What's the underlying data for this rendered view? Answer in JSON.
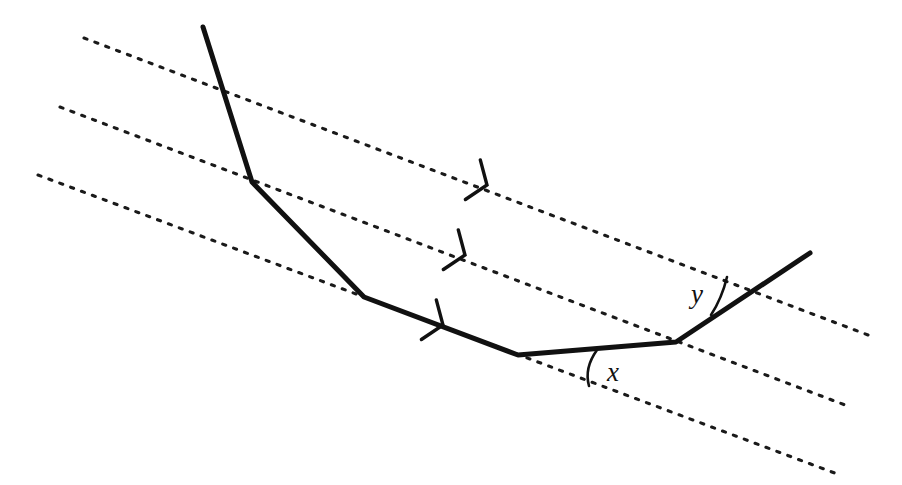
{
  "figure": {
    "background_color": "#ffffff",
    "stroke_color": "#111111",
    "width": 902,
    "height": 485
  },
  "parallel_lines": {
    "count": 3,
    "style": "dotted",
    "dot_color": "#1a1a1a",
    "slope": 0.377,
    "items": [
      {
        "name": "parallel-line-1",
        "x1": 84,
        "y1": 38,
        "x2": 868,
        "y2": 335
      },
      {
        "name": "parallel-line-2",
        "x1": 60,
        "y1": 107,
        "x2": 845,
        "y2": 405
      },
      {
        "name": "parallel-line-3",
        "x1": 38,
        "y1": 175,
        "x2": 840,
        "y2": 475
      }
    ]
  },
  "direction_arrows": {
    "count": 3,
    "shape": "chevron-right",
    "items": [
      {
        "name": "direction-arrow-1",
        "x": 487,
        "y": 185
      },
      {
        "name": "direction-arrow-2",
        "x": 465,
        "y": 255
      },
      {
        "name": "direction-arrow-3",
        "x": 443,
        "y": 325
      }
    ]
  },
  "polyline": {
    "name": "transversal-polyline",
    "stroke_width": 5,
    "points": "203,27 252,182 364,297 518,355 676,342 810,253",
    "vertices": [
      {
        "label": "start",
        "x": 203,
        "y": 27
      },
      {
        "label": "bend-1",
        "x": 252,
        "y": 182
      },
      {
        "label": "bend-2",
        "x": 364,
        "y": 297
      },
      {
        "label": "bend-3",
        "x": 518,
        "y": 355
      },
      {
        "label": "bend-4",
        "x": 676,
        "y": 342
      },
      {
        "label": "end",
        "x": 810,
        "y": 253
      }
    ]
  },
  "angles": [
    {
      "name": "angle-x",
      "label": "x",
      "label_x": 607,
      "label_y": 381,
      "arc_path": "M 597 350 Q 584 368 589 386",
      "vertex_x": 518,
      "vertex_y": 355
    },
    {
      "name": "angle-y",
      "label": "y",
      "label_x": 691,
      "label_y": 303,
      "arc_path": "M 727 277 Q 722 298 711 315",
      "vertex_x": 676,
      "vertex_y": 342
    }
  ]
}
